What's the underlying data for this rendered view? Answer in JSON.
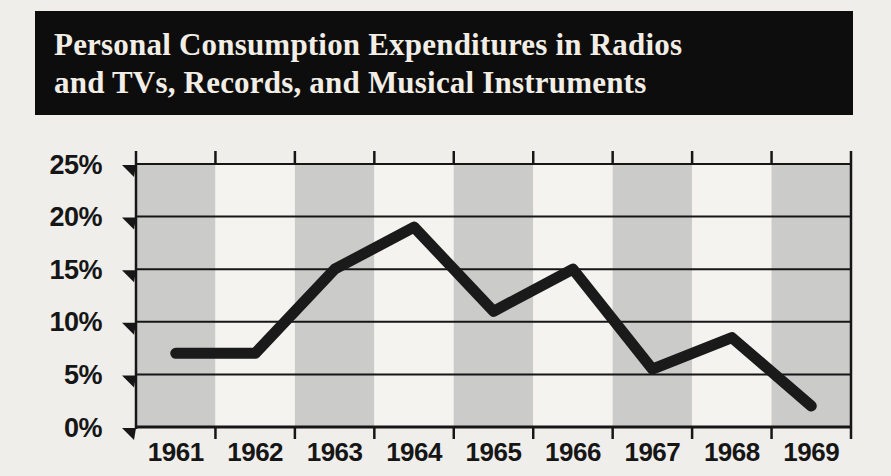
{
  "page": {
    "background": "#f0eeeb"
  },
  "title": {
    "lines": [
      "Personal Consumption Expenditures in Radios",
      "and TVs, Records, and Musical Instruments"
    ],
    "bar_color": "#0d0d0d",
    "text_color": "#f2eee5"
  },
  "chart_data": {
    "type": "line",
    "title": "Personal Consumption Expenditures in Radios and TVs, Records, and Musical Instruments",
    "categories": [
      "1961",
      "1962",
      "1963",
      "1964",
      "1965",
      "1966",
      "1967",
      "1968",
      "1969"
    ],
    "values": [
      7,
      7,
      15,
      19,
      11,
      15,
      5.5,
      8.5,
      2
    ],
    "unit": "%",
    "xlabel": "",
    "ylabel": "",
    "ylim": [
      0,
      25
    ],
    "ytick_step": 5,
    "ytick_labels": [
      "0%",
      "5%",
      "10%",
      "15%",
      "20%",
      "25%"
    ],
    "grid": true,
    "legend": false,
    "line_color": "#1a1a1a",
    "axis_color": "#161616",
    "label_color": "#161616",
    "band_shaded_color": "#cbcbca",
    "band_light_color": "#f4f3f0",
    "shaded_first_band": true
  }
}
